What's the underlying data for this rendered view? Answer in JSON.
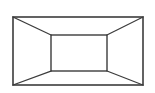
{
  "figure": {
    "kind": "one-point-perspective-room-diagram",
    "canvas": {
      "width": 155,
      "height": 93,
      "background_color": "#ffffff"
    },
    "style": {
      "line_color": "#3c3c3c",
      "line_width_outer": 1.6,
      "line_width_inner": 1.4,
      "line_width_diagonal": 1.3,
      "fill_color": "#ffffff",
      "shading_color": "#fdfdfd"
    },
    "outer_rectangle": {
      "name": "front opening",
      "left": 13,
      "top": 17,
      "right": 143,
      "bottom": 85,
      "width": 130,
      "height": 68,
      "corners": {
        "top_left": [
          13,
          17
        ],
        "top_right": [
          143,
          17
        ],
        "bottom_right": [
          143,
          85
        ],
        "bottom_left": [
          13,
          85
        ]
      }
    },
    "inner_rectangle": {
      "name": "back wall",
      "left": 51,
      "top": 35,
      "right": 107,
      "bottom": 71,
      "width": 56,
      "height": 36,
      "corners": {
        "top_left": [
          51,
          35
        ],
        "top_right": [
          107,
          35
        ],
        "bottom_right": [
          107,
          71
        ],
        "bottom_left": [
          51,
          71
        ]
      }
    },
    "vanishing_point": {
      "x": 79,
      "y": 53,
      "visible": false
    },
    "orthogonals": [
      {
        "name": "ceiling-left-orthogonal",
        "from": [
          13,
          17
        ],
        "to": [
          51,
          35
        ]
      },
      {
        "name": "ceiling-right-orthogonal",
        "from": [
          143,
          17
        ],
        "to": [
          107,
          35
        ]
      },
      {
        "name": "floor-right-orthogonal",
        "from": [
          143,
          85
        ],
        "to": [
          107,
          71
        ]
      },
      {
        "name": "floor-left-orthogonal",
        "from": [
          13,
          85
        ],
        "to": [
          51,
          71
        ]
      }
    ],
    "faces": [
      {
        "name": "back-wall-face",
        "points": "51,35 107,35 107,71 51,71"
      },
      {
        "name": "ceiling-face",
        "points": "13,17 143,17 107,35 51,35"
      },
      {
        "name": "floor-face",
        "points": "13,85 51,71 107,71 143,85"
      },
      {
        "name": "left-wall-face",
        "points": "13,17 51,35 51,71 13,85"
      },
      {
        "name": "right-wall-face",
        "points": "143,17 143,85 107,71 107,35"
      }
    ],
    "labels": []
  }
}
